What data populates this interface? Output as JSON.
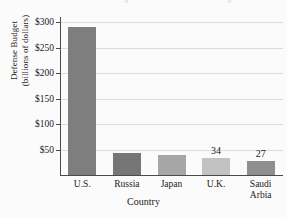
{
  "chart_data": {
    "type": "bar",
    "title": "",
    "xlabel": "Country",
    "ylabel_line1": "Defense Budget",
    "ylabel_line2": "(billions of dollars)",
    "categories": [
      "U.S.",
      "Russia",
      "Japan",
      "U.K.",
      "Saudi Arbia"
    ],
    "category_lines": [
      [
        "U.S."
      ],
      [
        "Russia"
      ],
      [
        "Japan"
      ],
      [
        "U.K."
      ],
      [
        "Saudi",
        "Arbia"
      ]
    ],
    "values": [
      291,
      44,
      40,
      34,
      27
    ],
    "point_labels": [
      "",
      "",
      "",
      "34",
      "27"
    ],
    "bar_colors": [
      "#7e7e7e",
      "#767676",
      "#a6a6a6",
      "#c2c2c2",
      "#8f8f8f"
    ],
    "ylim": [
      0,
      310
    ],
    "yticks": [
      50,
      100,
      150,
      200,
      250,
      300
    ],
    "ytick_labels": [
      "$50",
      "$100",
      "$150",
      "$200",
      "$250",
      "$300"
    ],
    "grid": "horizontal",
    "grid_color": "#dcdcdc",
    "axis_color": "#4a4a4a",
    "legend": "none",
    "background": "#fbfbfb"
  }
}
